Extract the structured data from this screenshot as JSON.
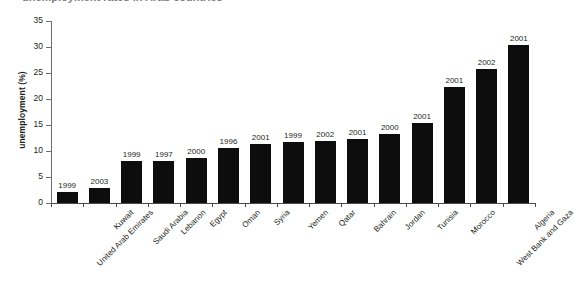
{
  "figure": {
    "clipped_title": "unemployment rates in Arab countries",
    "background_color": "#ffffff",
    "bar_color": "#0d0d0d",
    "axis_color": "#6e6e73",
    "text_color": "#231f20"
  },
  "chart_data": {
    "type": "bar",
    "title": "",
    "xlabel": "",
    "ylabel": "unemployment (%)",
    "ylim": [
      0,
      35
    ],
    "yticks": [
      0,
      5,
      10,
      15,
      20,
      25,
      30,
      35
    ],
    "grid": false,
    "legend": null,
    "orientation": "vertical",
    "sorted": "ascending",
    "categories": [
      "United Arab Emirates",
      "Kuwait",
      "Saudi Arabia",
      "Lebanon",
      "Egypt",
      "Oman",
      "Syria",
      "Yemen",
      "Qatar",
      "Bahrain",
      "Jordan",
      "Tunisia",
      "Morocco",
      "West Bank and Gaza",
      "Algeria"
    ],
    "values": [
      2.1,
      2.9,
      8.0,
      8.0,
      8.6,
      10.5,
      11.3,
      11.7,
      11.9,
      12.3,
      13.2,
      15.4,
      22.4,
      25.7,
      30.3
    ],
    "annotations": [
      "1999",
      "2003",
      "1999",
      "1997",
      "2000",
      "1996",
      "2001",
      "1999",
      "2002",
      "2001",
      "2000",
      "2001",
      "2001",
      "2002",
      "2001"
    ],
    "annotation_label": "survey year"
  }
}
